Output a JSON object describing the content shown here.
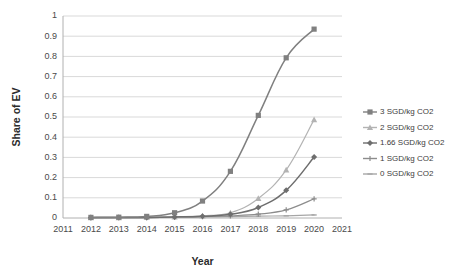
{
  "chart_data": {
    "type": "line",
    "title": "",
    "xlabel": "Year",
    "ylabel": "Share of EV",
    "x": [
      2012,
      2013,
      2014,
      2015,
      2016,
      2017,
      2018,
      2019,
      2020
    ],
    "xlim": [
      2011,
      2021
    ],
    "ylim": [
      0,
      1
    ],
    "xticks": [
      "2011",
      "2012",
      "2013",
      "2014",
      "2015",
      "2016",
      "2017",
      "2018",
      "2019",
      "2020",
      "2021"
    ],
    "yticks": [
      "0",
      "0.1",
      "0.2",
      "0.3",
      "0.4",
      "0.5",
      "0.6",
      "0.7",
      "0.8",
      "0.9",
      "1"
    ],
    "grid": "horizontal",
    "legend_position": "right",
    "series": [
      {
        "name": "3 SGD/kg CO2",
        "marker": "square",
        "color": "#808080",
        "values": [
          0.003,
          0.004,
          0.008,
          0.026,
          0.084,
          0.231,
          0.508,
          0.793,
          0.935
        ]
      },
      {
        "name": "2 SGD/kg CO2",
        "marker": "triangle",
        "color": "#b3b3b3",
        "values": [
          0.002,
          0.002,
          0.003,
          0.006,
          0.011,
          0.026,
          0.097,
          0.238,
          0.487
        ]
      },
      {
        "name": "1.66 SGD/kg CO2",
        "marker": "diamond",
        "color": "#6e6e6e",
        "values": [
          0.002,
          0.002,
          0.003,
          0.005,
          0.009,
          0.018,
          0.052,
          0.137,
          0.302
        ]
      },
      {
        "name": "1 SGD/kg CO2",
        "marker": "cross",
        "color": "#8c8c8c",
        "values": [
          0.001,
          0.002,
          0.002,
          0.004,
          0.007,
          0.011,
          0.019,
          0.04,
          0.095
        ]
      },
      {
        "name": "0 SGD/kg CO2",
        "marker": "dash",
        "color": "#a6a6a6",
        "values": [
          0.001,
          0.001,
          0.002,
          0.003,
          0.005,
          0.007,
          0.009,
          0.011,
          0.015
        ]
      }
    ]
  }
}
